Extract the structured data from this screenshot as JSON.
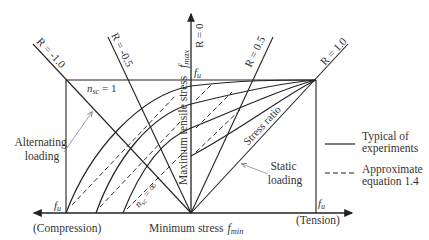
{
  "labels": {
    "r_minus_1": "R = -1.0",
    "r_minus_05": "R = -0.5",
    "r_0": "R = 0",
    "r_05": "R = 0.5",
    "r_1": "R = 1.0",
    "nsc_1": "n",
    "nsc_1_sub": "sc",
    "nsc_1_val": " = 1",
    "nsc_inf": "n",
    "nsc_inf_sub": "sc",
    "nsc_inf_val": " = ∞",
    "fmax_axis": "Maximum tensile stress",
    "fmax_sym": "f",
    "fmax_sub": "max",
    "fu_top": "f",
    "fu_top_sub": "u",
    "fu_left": "f",
    "fu_left_sub": "u",
    "fu_right": "f",
    "fu_right_sub": "u",
    "alternating_1": "Alternating",
    "alternating_2": "loading",
    "static_1": "Static",
    "static_2": "loading",
    "stress_ratio": "Stress ratio",
    "compression": "(Compression)",
    "tension": "(Tension)",
    "fmin_axis": "Minimum stress",
    "fmin_sym": "f",
    "fmin_sub": "min"
  },
  "legend": [
    {
      "style": "solid",
      "label_1": "Typical of",
      "label_2": "experiments"
    },
    {
      "style": "dashed",
      "label_1": "Approximate",
      "label_2": "equation 1.4"
    }
  ]
}
